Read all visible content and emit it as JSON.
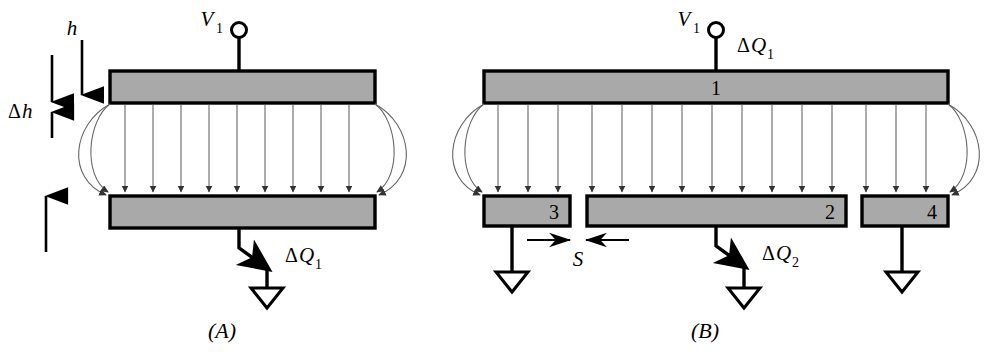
{
  "figure": {
    "panels": [
      {
        "caption": "(A)",
        "name": "panel-a",
        "terminal_label": "V",
        "terminal_sub": "1",
        "charge_label": "ΔQ",
        "charge_sub": "1",
        "dimension_h": "h",
        "dimension_delta_h": "Δh",
        "field_line_count": 9,
        "fringe_arc_count_per_side": 2,
        "plates": [
          {
            "id": "top",
            "label": ""
          },
          {
            "id": "bottom",
            "label": ""
          }
        ]
      },
      {
        "caption": "(B)",
        "name": "panel-b",
        "terminal_label": "V",
        "terminal_sub": "1",
        "charge_label_top": "ΔQ",
        "charge_sub_top": "1",
        "charge_label_bottom": "ΔQ",
        "charge_sub_bottom": "2",
        "gap_label": "S",
        "field_line_count": 15,
        "fringe_arc_count_per_side": 2,
        "plates": [
          {
            "id": "plate-1",
            "label": "1"
          },
          {
            "id": "plate-3",
            "label": "3"
          },
          {
            "id": "plate-2",
            "label": "2"
          },
          {
            "id": "plate-4",
            "label": "4"
          }
        ]
      }
    ],
    "colors": {
      "plate_fill": "#a9a9a9",
      "plate_stroke": "#000000",
      "field_line": "#555555",
      "lead_line": "#000000",
      "background": "#ffffff"
    }
  }
}
